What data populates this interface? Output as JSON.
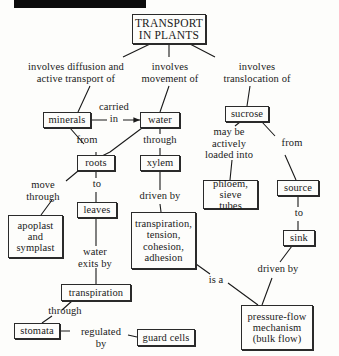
{
  "page": {
    "kind": "concept-map",
    "redaction_bar_present": true,
    "background_color": "#fdfdfb",
    "ink_color": "#1a1a1a",
    "box_border_color": "#2a2a2a"
  },
  "nodes": [
    {
      "id": "transport",
      "text": "TRANSPORT\nIN PLANTS",
      "x": 132,
      "y": 14,
      "w": 74,
      "h": 30,
      "font": 11.5
    },
    {
      "id": "minerals",
      "text": "minerals",
      "x": 43,
      "y": 112,
      "w": 48,
      "h": 16,
      "font": 10.5
    },
    {
      "id": "water",
      "text": "water",
      "x": 140,
      "y": 112,
      "w": 40,
      "h": 16,
      "font": 10.5
    },
    {
      "id": "sucrose",
      "text": "sucrose",
      "x": 225,
      "y": 106,
      "w": 44,
      "h": 16,
      "font": 10.5
    },
    {
      "id": "roots",
      "text": "roots",
      "x": 77,
      "y": 155,
      "w": 38,
      "h": 16,
      "font": 10.5
    },
    {
      "id": "xylem",
      "text": "xylem",
      "x": 140,
      "y": 155,
      "w": 40,
      "h": 16,
      "font": 10.5
    },
    {
      "id": "phloem",
      "text": "phloem,\nsieve tubes",
      "x": 203,
      "y": 180,
      "w": 55,
      "h": 29,
      "font": 10.5
    },
    {
      "id": "source",
      "text": "source",
      "x": 277,
      "y": 180,
      "w": 42,
      "h": 16,
      "font": 10.5
    },
    {
      "id": "leaves",
      "text": "leaves",
      "x": 77,
      "y": 202,
      "w": 40,
      "h": 16,
      "font": 10.5
    },
    {
      "id": "apoplast",
      "text": "apoplast\nand\nsymplast",
      "x": 8,
      "y": 215,
      "w": 55,
      "h": 43,
      "font": 10.5
    },
    {
      "id": "ttca",
      "text": "transpiration,\ntension,\ncohesion,\nadhesion",
      "x": 131,
      "y": 212,
      "w": 65,
      "h": 57,
      "font": 10.5
    },
    {
      "id": "sink",
      "text": "sink",
      "x": 283,
      "y": 230,
      "w": 32,
      "h": 16,
      "font": 10.5
    },
    {
      "id": "transpiration",
      "text": "transpiration",
      "x": 61,
      "y": 284,
      "w": 70,
      "h": 17,
      "font": 10.5
    },
    {
      "id": "stomata",
      "text": "stomata",
      "x": 14,
      "y": 323,
      "w": 46,
      "h": 16,
      "font": 10.5
    },
    {
      "id": "guardcells",
      "text": "guard cells",
      "x": 137,
      "y": 329,
      "w": 58,
      "h": 17,
      "font": 10.5
    },
    {
      "id": "pressureflow",
      "text": "pressure-flow\nmechanism\n(bulk flow)",
      "x": 241,
      "y": 305,
      "w": 72,
      "h": 45,
      "font": 10.5
    }
  ],
  "link_labels": [
    {
      "id": "l-diffusion",
      "text": "involves diffusion and\nactive transport of",
      "x": 12,
      "y": 61,
      "w": 128,
      "font": 10.5
    },
    {
      "id": "l-movement",
      "text": "involves\nmovement of",
      "x": 134,
      "y": 61,
      "w": 72,
      "font": 10.5
    },
    {
      "id": "l-translo",
      "text": "involves\ntranslocation of",
      "x": 212,
      "y": 61,
      "w": 90,
      "font": 10.5
    },
    {
      "id": "l-carried",
      "text": "carried\nin",
      "x": 93,
      "y": 101,
      "w": 42,
      "font": 10.5
    },
    {
      "id": "l-from1",
      "text": "from",
      "x": 72,
      "y": 134,
      "w": 30,
      "font": 10.5
    },
    {
      "id": "l-through1",
      "text": "through",
      "x": 135,
      "y": 134,
      "w": 50,
      "font": 10.5
    },
    {
      "id": "l-maybe",
      "text": "may be\nactively\nloaded into",
      "x": 195,
      "y": 126,
      "w": 68,
      "font": 10.5
    },
    {
      "id": "l-from2",
      "text": "from",
      "x": 276,
      "y": 137,
      "w": 32,
      "font": 10.5
    },
    {
      "id": "l-move",
      "text": "move\nthrough",
      "x": 18,
      "y": 179,
      "w": 50,
      "font": 10.5
    },
    {
      "id": "l-to1",
      "text": "to",
      "x": 88,
      "y": 178,
      "w": 18,
      "font": 10.5
    },
    {
      "id": "l-drivenby1",
      "text": "driven by",
      "x": 131,
      "y": 190,
      "w": 58,
      "font": 10.5
    },
    {
      "id": "l-to2",
      "text": "to",
      "x": 290,
      "y": 207,
      "w": 18,
      "font": 10.5
    },
    {
      "id": "l-waterexits",
      "text": "water\nexits by",
      "x": 71,
      "y": 246,
      "w": 48,
      "font": 10.5
    },
    {
      "id": "l-isa",
      "text": "is a",
      "x": 203,
      "y": 274,
      "w": 26,
      "font": 10.5
    },
    {
      "id": "l-drivenby2",
      "text": "driven by",
      "x": 249,
      "y": 263,
      "w": 58,
      "font": 10.5
    },
    {
      "id": "l-through2",
      "text": "through",
      "x": 40,
      "y": 305,
      "w": 50,
      "font": 10.5
    },
    {
      "id": "l-regulated",
      "text": "regulated\nby",
      "x": 72,
      "y": 326,
      "w": 58,
      "font": 10.5
    }
  ],
  "edges": [
    {
      "id": "e-transport-minerals",
      "from": "transport",
      "to": "minerals",
      "d": "M 150 44 L 123 57 M 90 86 L 78 112",
      "arrow": false
    },
    {
      "id": "e-transport-water",
      "from": "transport",
      "to": "water",
      "d": "M 169 44 L 169 57 M 169 86 L 160 112",
      "arrow": false
    },
    {
      "id": "e-transport-sucrose",
      "from": "transport",
      "to": "sucrose",
      "d": "M 190 44 L 215 57 M 250 86 L 247 106",
      "arrow": false
    },
    {
      "id": "e-minerals-water",
      "from": "minerals",
      "to": "water",
      "d": "M 91 120 L 107 120 M 123 120 L 140 120",
      "arrow": true
    },
    {
      "id": "e-minerals-roots",
      "from": "minerals",
      "to": "roots",
      "d": "M 70 128 L 84 144 M 96 152 L 96 155",
      "arrow": false
    },
    {
      "id": "e-water-roots",
      "from": "water",
      "to": "roots",
      "d": "M 142 128 L 110 152 M 110 152 L 100 157",
      "arrow": false
    },
    {
      "id": "e-water-xylem",
      "from": "water",
      "to": "xylem",
      "d": "M 160 128 L 160 134 M 160 148 L 160 155",
      "arrow": false
    },
    {
      "id": "e-sucrose-phloem",
      "from": "sucrose",
      "to": "phloem",
      "d": "M 240 122 L 235 126 M 232 160 L 230 180",
      "arrow": false
    },
    {
      "id": "e-sucrose-source",
      "from": "sucrose",
      "to": "source",
      "d": "M 262 122 L 275 136 M 285 155 L 296 180",
      "arrow": false
    },
    {
      "id": "e-roots-apoplast",
      "from": "roots",
      "to": "apoplast",
      "d": "M 78 171 L 66 181 M 52 200 L 41 215",
      "arrow": false
    },
    {
      "id": "e-roots-leaves",
      "from": "roots",
      "to": "leaves",
      "d": "M 96 171 L 96 178 M 96 192 L 96 202",
      "arrow": false
    },
    {
      "id": "e-xylem-ttca",
      "from": "xylem",
      "to": "ttca",
      "d": "M 160 171 L 160 190 M 160 204 L 161 212",
      "arrow": false
    },
    {
      "id": "e-source-sink",
      "from": "source",
      "to": "sink",
      "d": "M 298 196 L 298 207 M 298 221 L 298 230",
      "arrow": false
    },
    {
      "id": "e-leaves-transpir",
      "from": "leaves",
      "to": "transpiration",
      "d": "M 96 218 L 96 246 M 96 268 L 96 284",
      "arrow": false
    },
    {
      "id": "e-ttca-pressure",
      "from": "ttca",
      "to": "pressureflow",
      "d": "M 196 264 L 210 274 M 228 283 L 258 305",
      "arrow": false
    },
    {
      "id": "e-sink-pressure",
      "from": "sink",
      "to": "pressureflow",
      "d": "M 292 246 L 280 262 M 272 278 L 262 305",
      "arrow": false
    },
    {
      "id": "e-transpir-stomata",
      "from": "transpiration",
      "to": "stomata",
      "d": "M 72 301 L 62 310 M 52 316 L 42 323",
      "arrow": false
    },
    {
      "id": "e-stomata-guard",
      "from": "stomata",
      "to": "guardcells",
      "d": "M 60 331 L 70 331 M 128 335 L 137 337",
      "arrow": false
    }
  ]
}
